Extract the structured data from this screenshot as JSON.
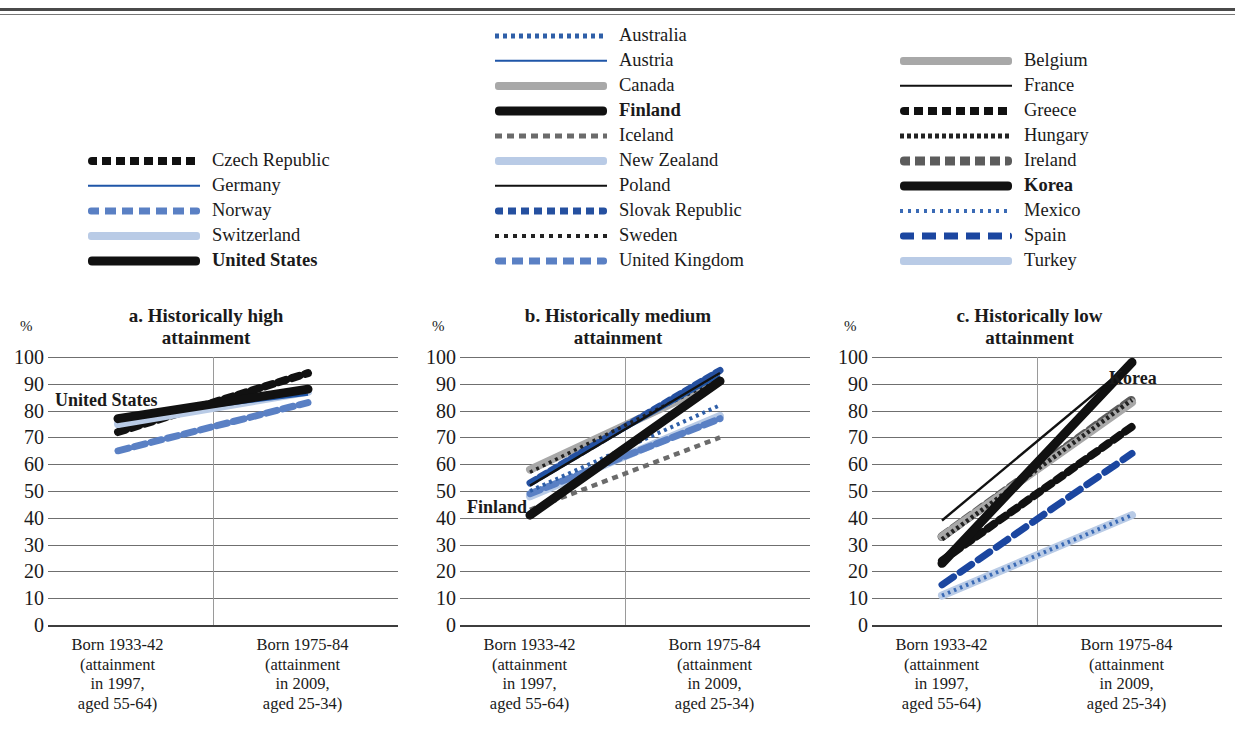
{
  "legend": {
    "columns": [
      {
        "id": "col-1",
        "items": [
          {
            "label": "Czech Republic",
            "style": "s-dots-black-big",
            "bold": false
          },
          {
            "label": "Germany",
            "style": "s-solid-blue",
            "bold": false
          },
          {
            "label": "Norway",
            "style": "s-dash-blue",
            "bold": false
          },
          {
            "label": "Switzerland",
            "style": "s-thick-ltblue",
            "bold": false
          },
          {
            "label": "United States",
            "style": "s-thick-black",
            "bold": true
          }
        ]
      },
      {
        "id": "col-2",
        "items": [
          {
            "label": "Australia",
            "style": "s-dot-blue-fine",
            "bold": false
          },
          {
            "label": "Austria",
            "style": "s-solid-blue",
            "bold": false
          },
          {
            "label": "Canada",
            "style": "s-thick-grey",
            "bold": false
          },
          {
            "label": "Finland",
            "style": "s-thick-black",
            "bold": true
          },
          {
            "label": "Iceland",
            "style": "s-dash-grey",
            "bold": false
          },
          {
            "label": "New Zealand",
            "style": "s-thick-ltblue",
            "bold": false
          },
          {
            "label": "Poland",
            "style": "s-solid-black",
            "bold": false
          },
          {
            "label": "Slovak Republic",
            "style": "s-dots-blue-big",
            "bold": false
          },
          {
            "label": "Sweden",
            "style": "s-dots-black-fine",
            "bold": false
          },
          {
            "label": "United Kingdom",
            "style": "s-dash-blue",
            "bold": false
          }
        ]
      },
      {
        "id": "col-3",
        "items": [
          {
            "label": "Belgium",
            "style": "s-thick-grey",
            "bold": false
          },
          {
            "label": "France",
            "style": "s-solid-black",
            "bold": false
          },
          {
            "label": "Greece",
            "style": "s-dots-black-big",
            "bold": false
          },
          {
            "label": "Hungary",
            "style": "s-dots-black-tiny",
            "bold": false
          },
          {
            "label": "Ireland",
            "style": "s-dots-grey-big",
            "bold": false
          },
          {
            "label": "Korea",
            "style": "s-thick-black",
            "bold": true
          },
          {
            "label": "Mexico",
            "style": "s-dots-blue-tiny",
            "bold": false
          },
          {
            "label": "Spain",
            "style": "s-dash-blue-dk",
            "bold": false
          },
          {
            "label": "Turkey",
            "style": "s-thick-ltblue",
            "bold": false
          }
        ]
      }
    ]
  },
  "axis": {
    "unit": "%",
    "yticks": [
      "100",
      "90",
      "80",
      "70",
      "60",
      "50",
      "40",
      "30",
      "20",
      "10",
      "0"
    ],
    "xlabels": [
      "Born 1933-42\n(attainment\nin 1997,\naged 55-64)",
      "Born 1975-84\n(attainment\nin 2009,\naged 25-34)"
    ],
    "xlabel_left_l1": "Born 1933-42",
    "xlabel_left_l2": "(attainment",
    "xlabel_left_l3": "in 1997,",
    "xlabel_left_l4": "aged 55-64)",
    "xlabel_right_l1": "Born 1975-84",
    "xlabel_right_l2": "(attainment",
    "xlabel_right_l3": "in 2009,",
    "xlabel_right_l4": "aged 25-34)"
  },
  "panels": [
    {
      "id": "a",
      "title_l1": "a. Historically high",
      "title_l2": "attainment",
      "annotation": "United States"
    },
    {
      "id": "b",
      "title_l1": "b. Historically medium",
      "title_l2": "attainment",
      "annotation": "Finland"
    },
    {
      "id": "c",
      "title_l1": "c. Historically low",
      "title_l2": "attainment",
      "annotation": "Korea"
    }
  ],
  "colors": {
    "black": "#111111",
    "blue": "#1f56a8",
    "blue_mid": "#5a80c4",
    "blue_dark": "#1b46a0",
    "light_blue": "#b9cbe6",
    "grey": "#a8a8a8",
    "grey_dark": "#5c5c5c",
    "gridline": "#6f6f6f"
  },
  "chart_data": {
    "type": "line",
    "xlabel": "",
    "ylabel": "%",
    "ylim": [
      0,
      100
    ],
    "grid": true,
    "legend_position": "top",
    "x": [
      "Born 1933-42 (attainment in 1997, aged 55-64)",
      "Born 1975-84 (attainment in 2009, aged 25-34)"
    ],
    "panels": [
      {
        "id": "a",
        "title": "a. Historically high attainment",
        "series": [
          {
            "name": "Czech Republic",
            "values": [
              72,
              94
            ],
            "style": "s-dots-black-big"
          },
          {
            "name": "Germany",
            "values": [
              77,
              86
            ],
            "style": "s-solid-blue"
          },
          {
            "name": "Norway",
            "values": [
              65,
              83
            ],
            "style": "s-dash-blue"
          },
          {
            "name": "Switzerland",
            "values": [
              75,
              87
            ],
            "style": "s-thick-ltblue"
          },
          {
            "name": "United States",
            "values": [
              77,
              88
            ],
            "style": "s-thick-black"
          }
        ]
      },
      {
        "id": "b",
        "title": "b. Historically medium attainment",
        "series": [
          {
            "name": "Australia",
            "values": [
              50,
              82
            ],
            "style": "s-dot-blue-fine"
          },
          {
            "name": "Austria",
            "values": [
              53,
              93
            ],
            "style": "s-solid-blue"
          },
          {
            "name": "Canada",
            "values": [
              58,
              91
            ],
            "style": "s-thick-grey"
          },
          {
            "name": "Finland",
            "values": [
              41,
              91
            ],
            "style": "s-thick-black"
          },
          {
            "name": "Iceland",
            "values": [
              43,
              70
            ],
            "style": "s-dash-grey"
          },
          {
            "name": "New Zealand",
            "values": [
              48,
              78
            ],
            "style": "s-thick-ltblue"
          },
          {
            "name": "Poland",
            "values": [
              52,
              94
            ],
            "style": "s-solid-black"
          },
          {
            "name": "Slovak Republic",
            "values": [
              53,
              95
            ],
            "style": "s-dots-blue-big"
          },
          {
            "name": "Sweden",
            "values": [
              57,
              92
            ],
            "style": "s-dots-black-fine"
          },
          {
            "name": "United Kingdom",
            "values": [
              49,
              77
            ],
            "style": "s-dash-blue"
          }
        ]
      },
      {
        "id": "c",
        "title": "c. Historically low attainment",
        "series": [
          {
            "name": "Belgium",
            "values": [
              33,
              83
            ],
            "style": "s-thick-grey"
          },
          {
            "name": "France",
            "values": [
              39,
              98
            ],
            "style": "s-solid-black"
          },
          {
            "name": "Greece",
            "values": [
              24,
              74
            ],
            "style": "s-dots-black-big"
          },
          {
            "name": "Hungary",
            "values": [
              32,
              84
            ],
            "style": "s-dots-black-tiny"
          },
          {
            "name": "Ireland",
            "values": [
              33,
              84
            ],
            "style": "s-dots-grey-big"
          },
          {
            "name": "Korea",
            "values": [
              23,
              98
            ],
            "style": "s-thick-black"
          },
          {
            "name": "Mexico",
            "values": [
              11,
              41
            ],
            "style": "s-dots-blue-tiny"
          },
          {
            "name": "Spain",
            "values": [
              15,
              64
            ],
            "style": "s-dash-blue-dk"
          },
          {
            "name": "Turkey",
            "values": [
              11,
              41
            ],
            "style": "s-thick-ltblue"
          }
        ]
      }
    ]
  }
}
